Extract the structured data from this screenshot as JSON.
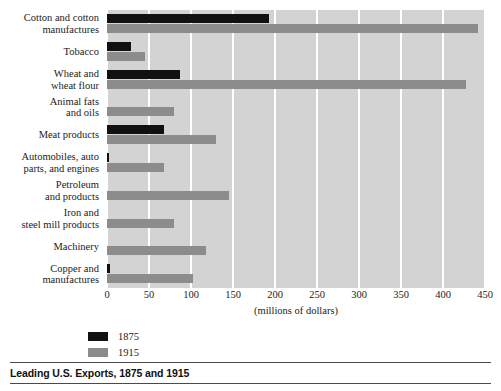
{
  "caption": {
    "title": "Leading U.S. Exports, 1875 and 1915"
  },
  "legend": {
    "entries": [
      {
        "label": "1875",
        "color": "#111111"
      },
      {
        "label": "1915",
        "color": "#8c8c8c"
      }
    ]
  },
  "axis": {
    "title": "(millions of dollars)",
    "ticks": [
      "0",
      "50",
      "100",
      "150",
      "200",
      "250",
      "300",
      "350",
      "400",
      "450"
    ]
  },
  "chart_data": {
    "type": "bar",
    "orientation": "horizontal",
    "title": "Leading U.S. Exports, 1875 and 1915",
    "xlabel": "(millions of dollars)",
    "ylabel": "",
    "xlim": [
      0,
      450
    ],
    "xticks": [
      0,
      50,
      100,
      150,
      200,
      250,
      300,
      350,
      400,
      450
    ],
    "grid": "vertical-white-gridlines",
    "legend_position": "below-axis-left",
    "categories": [
      "Cotton and cotton manufactures",
      "Tobacco",
      "Wheat and wheat flour",
      "Animal fats and oils",
      "Meat products",
      "Automobiles, auto parts, and engines",
      "Petroleum and products",
      "Iron and steel mill products",
      "Machinery",
      "Copper and manufactures"
    ],
    "category_lines": [
      [
        "Cotton and cotton",
        "manufactures"
      ],
      [
        "Tobacco"
      ],
      [
        "Wheat and",
        "wheat flour"
      ],
      [
        "Animal fats",
        "and oils"
      ],
      [
        "Meat products"
      ],
      [
        "Automobiles, auto",
        "parts, and engines"
      ],
      [
        "Petroleum",
        "and products"
      ],
      [
        "Iron and",
        "steel mill products"
      ],
      [
        "Machinery"
      ],
      [
        "Copper and",
        "manufactures"
      ]
    ],
    "series": [
      {
        "name": "1875",
        "color": "#111111",
        "values": [
          193,
          28,
          87,
          0,
          68,
          2,
          0,
          0,
          0,
          3
        ]
      },
      {
        "name": "1915",
        "color": "#8c8c8c",
        "values": [
          442,
          45,
          427,
          80,
          130,
          68,
          145,
          80,
          118,
          102
        ]
      }
    ]
  }
}
